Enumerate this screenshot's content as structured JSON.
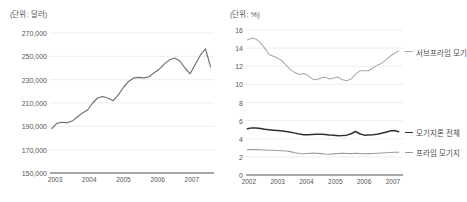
{
  "chart_data": [
    {
      "type": "line",
      "id": "us-existing-home-price",
      "title": "",
      "unit_note": "(단위: 달러)",
      "xlabel": "",
      "ylabel": "",
      "ylim": [
        150000,
        270000
      ],
      "yticks": [
        150000,
        170000,
        190000,
        210000,
        230000,
        250000,
        270000
      ],
      "ytick_labels": [
        "150,000",
        "170,000",
        "190,000",
        "210,000",
        "230,000",
        "250,000",
        "270,000"
      ],
      "xticks": [
        2003,
        2004,
        2005,
        2006,
        2007
      ],
      "xtick_labels": [
        "2003",
        "2004",
        "2005",
        "2006",
        "2007"
      ],
      "xlim": [
        2002.85,
        2007.65
      ],
      "grid": true,
      "legend": "none",
      "series": [
        {
          "name": "주택가격",
          "color": "#6e6e6e",
          "x": [
            2002.9,
            2003.05,
            2003.2,
            2003.35,
            2003.5,
            2003.65,
            2003.8,
            2003.95,
            2004.1,
            2004.25,
            2004.4,
            2004.55,
            2004.7,
            2004.85,
            2005.0,
            2005.15,
            2005.3,
            2005.45,
            2005.6,
            2005.75,
            2005.9,
            2006.05,
            2006.2,
            2006.35,
            2006.5,
            2006.65,
            2006.8,
            2006.95,
            2007.1,
            2007.25,
            2007.4,
            2007.55
          ],
          "y": [
            188000,
            192500,
            193500,
            193000,
            194500,
            198000,
            201500,
            204000,
            210000,
            214500,
            215500,
            214000,
            212000,
            217000,
            223500,
            228500,
            231500,
            232000,
            231500,
            232500,
            236000,
            239000,
            243500,
            247000,
            248500,
            246000,
            240000,
            235000,
            243000,
            251000,
            256500,
            241000
          ]
        }
      ]
    },
    {
      "type": "line",
      "id": "us-mortgage-delinquency",
      "title": "",
      "unit_note": "(단위: %)",
      "xlabel": "",
      "ylabel": "",
      "ylim": [
        0,
        16
      ],
      "yticks": [
        0,
        2,
        4,
        6,
        8,
        10,
        12,
        14,
        16
      ],
      "ytick_labels": [
        "0",
        "2",
        "4",
        "6",
        "8",
        "10",
        "12",
        "14",
        "16"
      ],
      "xticks": [
        2002,
        2003,
        2004,
        2005,
        2006,
        2007
      ],
      "xtick_labels": [
        "2002",
        "2003",
        "2004",
        "2005",
        "2006",
        "2007"
      ],
      "xlim": [
        2001.9,
        2007.35
      ],
      "grid": true,
      "legend": "right-inline",
      "series": [
        {
          "name": "서브프라임 모기",
          "color": "#a8a8a8",
          "label_y": 13.6,
          "x": [
            2001.95,
            2002.1,
            2002.25,
            2002.4,
            2002.55,
            2002.7,
            2002.85,
            2003.0,
            2003.15,
            2003.3,
            2003.45,
            2003.6,
            2003.75,
            2003.9,
            2004.05,
            2004.2,
            2004.35,
            2004.5,
            2004.65,
            2004.8,
            2004.95,
            2005.1,
            2005.25,
            2005.4,
            2005.55,
            2005.7,
            2005.85,
            2006.0,
            2006.15,
            2006.3,
            2006.45,
            2006.6,
            2006.75,
            2006.9,
            2007.05,
            2007.2
          ],
          "y": [
            14.9,
            15.1,
            15.0,
            14.6,
            14.0,
            13.3,
            13.1,
            12.9,
            12.6,
            12.1,
            11.6,
            11.3,
            11.1,
            11.2,
            11.0,
            10.6,
            10.5,
            10.7,
            10.8,
            10.6,
            10.7,
            10.8,
            10.5,
            10.4,
            10.6,
            11.1,
            11.5,
            11.5,
            11.5,
            11.8,
            12.1,
            12.3,
            12.7,
            13.1,
            13.4,
            13.7
          ]
        },
        {
          "name": "모기지론 전체",
          "color": "#2f2f2f",
          "label_y": 4.7,
          "x": [
            2001.95,
            2002.1,
            2002.25,
            2002.4,
            2002.55,
            2002.7,
            2002.85,
            2003.0,
            2003.15,
            2003.3,
            2003.45,
            2003.6,
            2003.75,
            2003.9,
            2004.05,
            2004.2,
            2004.35,
            2004.5,
            2004.65,
            2004.8,
            2004.95,
            2005.1,
            2005.25,
            2005.4,
            2005.55,
            2005.7,
            2005.85,
            2006.0,
            2006.15,
            2006.3,
            2006.45,
            2006.6,
            2006.75,
            2006.9,
            2007.05,
            2007.2
          ],
          "y": [
            5.1,
            5.2,
            5.18,
            5.12,
            5.05,
            5.0,
            4.95,
            4.9,
            4.85,
            4.8,
            4.72,
            4.62,
            4.52,
            4.45,
            4.45,
            4.47,
            4.5,
            4.5,
            4.48,
            4.42,
            4.38,
            4.32,
            4.35,
            4.4,
            4.55,
            4.8,
            4.55,
            4.4,
            4.42,
            4.45,
            4.5,
            4.6,
            4.72,
            4.85,
            4.9,
            4.78
          ]
        },
        {
          "name": "프라임 모기지",
          "color": "#9a9a9a",
          "label_y": 2.5,
          "x": [
            2001.95,
            2002.1,
            2002.25,
            2002.4,
            2002.55,
            2002.7,
            2002.85,
            2003.0,
            2003.15,
            2003.3,
            2003.45,
            2003.6,
            2003.75,
            2003.9,
            2004.05,
            2004.2,
            2004.35,
            2004.5,
            2004.65,
            2004.8,
            2004.95,
            2005.1,
            2005.25,
            2005.4,
            2005.55,
            2005.7,
            2005.85,
            2006.0,
            2006.15,
            2006.3,
            2006.45,
            2006.6,
            2006.75,
            2006.9,
            2007.05,
            2007.2
          ],
          "y": [
            2.8,
            2.82,
            2.8,
            2.78,
            2.76,
            2.74,
            2.72,
            2.7,
            2.68,
            2.65,
            2.58,
            2.45,
            2.38,
            2.35,
            2.38,
            2.42,
            2.4,
            2.36,
            2.32,
            2.3,
            2.33,
            2.38,
            2.4,
            2.38,
            2.36,
            2.4,
            2.38,
            2.35,
            2.36,
            2.38,
            2.4,
            2.43,
            2.45,
            2.48,
            2.52,
            2.5
          ]
        }
      ]
    }
  ],
  "colors": {
    "grid": "#e2e2e2",
    "axis": "#8a8a8a",
    "text": "#555555",
    "background": "#ffffff"
  }
}
